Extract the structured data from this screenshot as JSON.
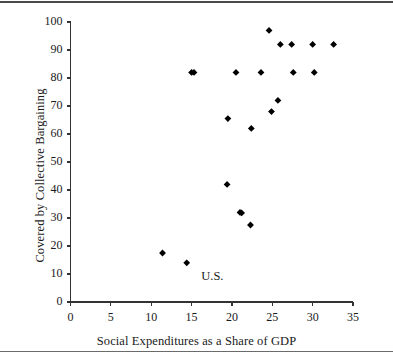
{
  "chart_data": {
    "type": "scatter",
    "title": "",
    "xlabel": "Social Expenditures as a Share of GDP",
    "ylabel": "Covered by Collective Bargaining",
    "xlim": [
      0,
      35
    ],
    "ylim": [
      0,
      100
    ],
    "xticks": [
      0,
      5,
      10,
      15,
      20,
      25,
      30,
      35
    ],
    "yticks": [
      0,
      10,
      20,
      30,
      40,
      50,
      60,
      70,
      80,
      90,
      100
    ],
    "grid": false,
    "legend": null,
    "marker": "diamond",
    "marker_color": "#000000",
    "points": [
      {
        "x": 11.4,
        "y": 17.5
      },
      {
        "x": 14.4,
        "y": 14.0
      },
      {
        "x": 15.0,
        "y": 82.0
      },
      {
        "x": 15.3,
        "y": 82.0
      },
      {
        "x": 19.4,
        "y": 42.0
      },
      {
        "x": 19.5,
        "y": 65.5
      },
      {
        "x": 20.5,
        "y": 82.0
      },
      {
        "x": 21.0,
        "y": 32.0
      },
      {
        "x": 21.2,
        "y": 31.8
      },
      {
        "x": 22.3,
        "y": 27.5
      },
      {
        "x": 22.4,
        "y": 62.0
      },
      {
        "x": 23.6,
        "y": 82.0
      },
      {
        "x": 24.6,
        "y": 97.0
      },
      {
        "x": 24.9,
        "y": 68.0
      },
      {
        "x": 25.7,
        "y": 72.0
      },
      {
        "x": 26.0,
        "y": 92.0
      },
      {
        "x": 27.4,
        "y": 92.0
      },
      {
        "x": 27.6,
        "y": 82.0
      },
      {
        "x": 30.0,
        "y": 92.0
      },
      {
        "x": 30.2,
        "y": 82.0
      },
      {
        "x": 32.6,
        "y": 92.0
      }
    ],
    "annotations": [
      {
        "text": "U.S.",
        "x": 16.2,
        "y": 8.5
      }
    ]
  }
}
